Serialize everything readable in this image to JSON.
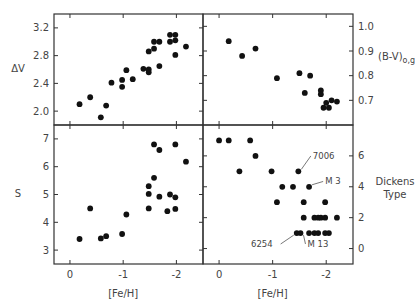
{
  "chart_data": [
    {
      "id": "dv",
      "type": "scatter",
      "panel": "top-left",
      "xlabel": "",
      "ylabel": "ΔV",
      "xlim": [
        0.3,
        -2.5
      ],
      "ylim": [
        1.8,
        3.4
      ],
      "xticks": [
        0,
        -1,
        -2
      ],
      "xtick_labels": [],
      "yticks": [
        2.0,
        2.4,
        2.8,
        3.2
      ],
      "ytick_labels": [
        "2.0",
        "2.4",
        "2.8",
        "3.2"
      ],
      "ytick_side": "left",
      "points": [
        [
          -0.18,
          2.1
        ],
        [
          -0.38,
          2.2
        ],
        [
          -0.58,
          1.91
        ],
        [
          -0.68,
          2.08
        ],
        [
          -0.78,
          2.41
        ],
        [
          -0.98,
          2.35
        ],
        [
          -0.98,
          2.45
        ],
        [
          -1.06,
          2.59
        ],
        [
          -1.18,
          2.46
        ],
        [
          -1.38,
          2.61
        ],
        [
          -1.48,
          2.6
        ],
        [
          -1.48,
          2.56
        ],
        [
          -1.48,
          2.86
        ],
        [
          -1.58,
          2.9
        ],
        [
          -1.58,
          3.0
        ],
        [
          -1.68,
          3.0
        ],
        [
          -1.68,
          2.65
        ],
        [
          -1.88,
          3.0
        ],
        [
          -1.88,
          3.1
        ],
        [
          -1.98,
          3.1
        ],
        [
          -1.98,
          3.02
        ],
        [
          -1.98,
          2.81
        ],
        [
          -2.18,
          2.93
        ]
      ]
    },
    {
      "id": "bv",
      "type": "scatter",
      "panel": "top-right",
      "xlabel": "",
      "ylabel": "(B-V)o,g",
      "xlim": [
        0.3,
        -2.5
      ],
      "ylim": [
        0.6,
        1.05
      ],
      "xticks": [
        0,
        -1,
        -2
      ],
      "xtick_labels": [],
      "yticks": [
        0.7,
        0.8,
        0.9,
        1.0
      ],
      "ytick_labels": [
        "0.7",
        "0.8",
        "0.9",
        "1.0"
      ],
      "ytick_side": "right",
      "points": [
        [
          -0.18,
          0.94
        ],
        [
          -0.43,
          0.88
        ],
        [
          -0.68,
          0.91
        ],
        [
          -1.08,
          0.79
        ],
        [
          -1.5,
          0.81
        ],
        [
          -1.6,
          0.73
        ],
        [
          -1.7,
          0.8
        ],
        [
          -1.9,
          0.74
        ],
        [
          -1.9,
          0.725
        ],
        [
          -1.95,
          0.67
        ],
        [
          -2.0,
          0.69
        ],
        [
          -2.05,
          0.67
        ],
        [
          -2.1,
          0.7
        ],
        [
          -2.2,
          0.695
        ]
      ]
    },
    {
      "id": "s",
      "type": "scatter",
      "panel": "bottom-left",
      "xlabel": "[Fe/H]",
      "ylabel": "S",
      "xlim": [
        0.3,
        -2.5
      ],
      "ylim": [
        2.5,
        7.5
      ],
      "xticks": [
        0,
        -1,
        -2
      ],
      "xtick_labels": [
        "0",
        "-1",
        "-2"
      ],
      "yticks": [
        3,
        4,
        5,
        6,
        7
      ],
      "ytick_labels": [
        "3",
        "4",
        "5",
        "6",
        "7"
      ],
      "ytick_side": "left",
      "points": [
        [
          -0.18,
          3.4
        ],
        [
          -0.38,
          4.5
        ],
        [
          -0.58,
          3.42
        ],
        [
          -0.68,
          3.5
        ],
        [
          -0.98,
          3.58
        ],
        [
          -1.06,
          4.28
        ],
        [
          -1.48,
          5.3
        ],
        [
          -1.48,
          5.02
        ],
        [
          -1.48,
          4.5
        ],
        [
          -1.58,
          6.8
        ],
        [
          -1.58,
          5.6
        ],
        [
          -1.68,
          6.6
        ],
        [
          -1.68,
          4.92
        ],
        [
          -1.83,
          4.4
        ],
        [
          -1.88,
          5.0
        ],
        [
          -1.98,
          6.8
        ],
        [
          -1.98,
          4.9
        ],
        [
          -1.98,
          4.48
        ],
        [
          -2.18,
          6.18
        ]
      ]
    },
    {
      "id": "dickens",
      "type": "scatter",
      "panel": "bottom-right",
      "xlabel": "[Fe/H]",
      "ylabel": "Dickens Type",
      "xlim": [
        0.3,
        -2.5
      ],
      "ylim": [
        -1,
        8
      ],
      "xticks": [
        0,
        -1,
        -2
      ],
      "xtick_labels": [
        "0",
        "-1",
        "-2"
      ],
      "yticks": [
        0,
        2,
        4,
        6
      ],
      "ytick_labels": [
        "0",
        "2",
        "4",
        "6"
      ],
      "ytick_side": "right",
      "points": [
        [
          0.0,
          7
        ],
        [
          -0.18,
          7
        ],
        [
          -0.58,
          7
        ],
        [
          -0.68,
          6
        ],
        [
          -0.38,
          5
        ],
        [
          -0.98,
          5
        ],
        [
          -1.48,
          5
        ],
        [
          -1.18,
          4
        ],
        [
          -1.38,
          4
        ],
        [
          -1.68,
          4
        ],
        [
          -1.08,
          3
        ],
        [
          -1.58,
          3
        ],
        [
          -1.98,
          3
        ],
        [
          -1.58,
          2
        ],
        [
          -1.78,
          2
        ],
        [
          -1.85,
          2
        ],
        [
          -1.9,
          2
        ],
        [
          -1.98,
          2
        ],
        [
          -2.2,
          2
        ],
        [
          -1.45,
          1
        ],
        [
          -1.52,
          1
        ],
        [
          -1.68,
          1
        ],
        [
          -1.78,
          1
        ],
        [
          -1.85,
          1
        ],
        [
          -1.98,
          1
        ],
        [
          -2.05,
          1
        ]
      ],
      "annotations": [
        {
          "text": "7006",
          "x": -1.48,
          "y": 5,
          "tx": -1.75,
          "ty": 5.8
        },
        {
          "text": "M 3",
          "x": -1.68,
          "y": 4,
          "tx": -1.98,
          "ty": 4.15
        },
        {
          "text": "6254",
          "x": -1.45,
          "y": 1,
          "tx": -1.0,
          "ty": 0.1
        },
        {
          "text": "M 13",
          "x": -1.52,
          "y": 1,
          "tx": -1.65,
          "ty": 0.1
        }
      ]
    }
  ]
}
